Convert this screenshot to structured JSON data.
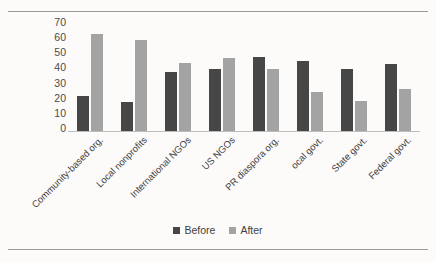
{
  "chart_data": {
    "type": "bar",
    "title": "",
    "xlabel": "",
    "ylabel": "",
    "ylim": [
      0,
      70
    ],
    "yticks": [
      "70",
      "60",
      "50",
      "40",
      "30",
      "20",
      "10",
      "0"
    ],
    "grid": false,
    "legend_position": "bottom-center",
    "categories": [
      "Community-based org.",
      "Local nonprofits",
      "International NGOs",
      "US NGOs",
      "PR diaspora org.",
      "ocal govt.",
      "State govt.",
      "Federal govt."
    ],
    "series": [
      {
        "name": "Before",
        "color": "#464646",
        "values": [
          23,
          19,
          39,
          41,
          49,
          46,
          41,
          44
        ]
      },
      {
        "name": "After",
        "color": "#a3a3a3",
        "values": [
          64,
          60,
          45,
          48,
          41,
          26,
          20,
          28
        ]
      }
    ]
  },
  "legend": {
    "items": [
      {
        "label": "Before",
        "color": "#464646"
      },
      {
        "label": "After",
        "color": "#a3a3a3"
      }
    ]
  }
}
